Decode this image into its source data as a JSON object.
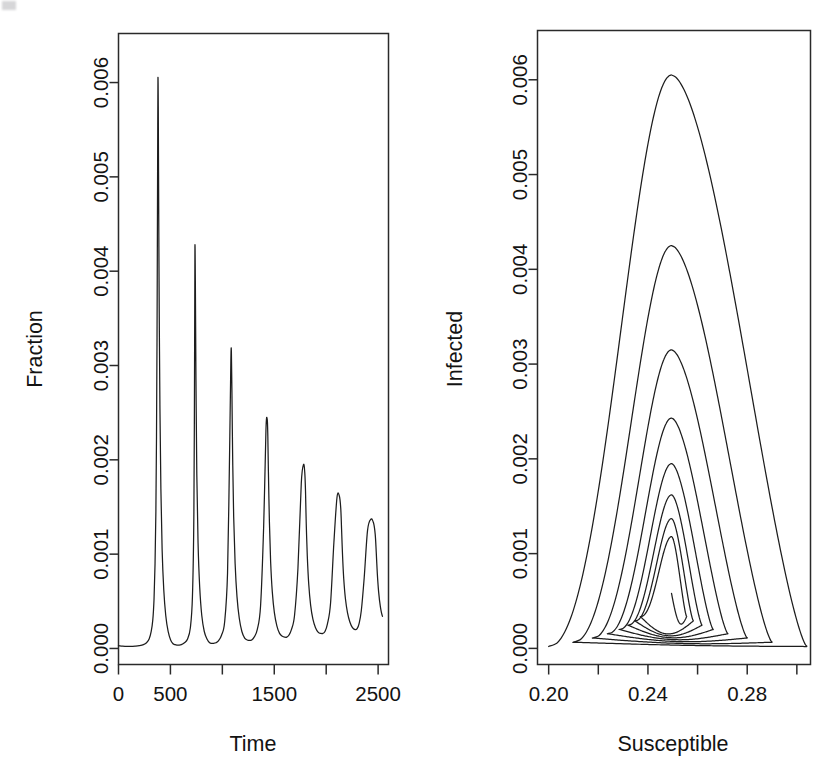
{
  "figure": {
    "background_color": "#ffffff",
    "line_color": "#1d1d1d",
    "panel_count": 2
  },
  "chart_data": [
    {
      "type": "line",
      "panel": "left",
      "title": "",
      "xlabel": "Time",
      "ylabel": "Fraction",
      "xlim": [
        0,
        2600
      ],
      "ylim": [
        -0.00017,
        0.00652
      ],
      "grid": false,
      "legend": null,
      "xticks": [
        0,
        500,
        1000,
        1500,
        2000,
        2500
      ],
      "xticklabels": [
        "0",
        "500",
        "",
        "1500",
        "",
        "2500"
      ],
      "yticks": [
        0.0,
        0.001,
        0.002,
        0.003,
        0.004,
        0.005,
        0.006
      ],
      "yticklabels": [
        "0.000",
        "0.001",
        "0.002",
        "0.003",
        "0.004",
        "0.005",
        "0.006"
      ],
      "description": "Damped epidemic oscillation: fraction infected over time",
      "peaks": [
        {
          "time": 380,
          "value": 0.00605
        },
        {
          "time": 735,
          "value": 0.00425
        },
        {
          "time": 1085,
          "value": 0.00315
        },
        {
          "time": 1430,
          "value": 0.00243
        },
        {
          "time": 1775,
          "value": 0.00195
        },
        {
          "time": 2110,
          "value": 0.00162
        },
        {
          "time": 2440,
          "value": 0.00137
        },
        {
          "time": 2770,
          "value": 0.00118
        }
      ],
      "troughs": [
        {
          "time": 560,
          "value": 3.5e-05
        },
        {
          "time": 915,
          "value": 5.5e-05
        },
        {
          "time": 1265,
          "value": 8.5e-05
        },
        {
          "time": 1610,
          "value": 0.00012
        },
        {
          "time": 1950,
          "value": 0.00016
        },
        {
          "time": 2285,
          "value": 0.0002
        },
        {
          "time": 2610,
          "value": 0.00025
        }
      ],
      "series": [
        {
          "name": "Infected fraction",
          "x": [
            0,
            40,
            80,
            120,
            160,
            200,
            240,
            270,
            295,
            315,
            330,
            342,
            352,
            360,
            366,
            371,
            375,
            378,
            380,
            383,
            387,
            392,
            399,
            408,
            420,
            436,
            455,
            478,
            502,
            525,
            545,
            562,
            580,
            605,
            635,
            665,
            692,
            712,
            726,
            733,
            736,
            740,
            746,
            754,
            766,
            782,
            802,
            826,
            852,
            878,
            900,
            918,
            938,
            962,
            992,
            1022,
            1050,
            1070,
            1082,
            1087,
            1092,
            1099,
            1109,
            1123,
            1141,
            1163,
            1188,
            1215,
            1240,
            1262,
            1282,
            1306,
            1336,
            1368,
            1398,
            1420,
            1432,
            1438,
            1444,
            1453,
            1465,
            1481,
            1501,
            1525,
            1551,
            1578,
            1601,
            1620,
            1640,
            1665,
            1695,
            1728,
            1760,
            1782,
            1794,
            1801,
            1808,
            1818,
            1832,
            1850,
            1872,
            1897,
            1924,
            1948,
            1968,
            1988,
            2012,
            2042,
            2074,
            2104,
            2126,
            2140,
            2148,
            2157,
            2169,
            2185,
            2205,
            2228,
            2253,
            2278,
            2298,
            2316,
            2338,
            2366,
            2398,
            2430,
            2456,
            2472,
            2482,
            2492,
            2505,
            2522,
            2542,
            2566,
            2590,
            2600
          ],
          "y": [
            3e-05,
            2.5e-05,
            2.2e-05,
            2.2e-05,
            2.5e-05,
            3e-05,
            4e-05,
            6e-05,
            0.0001,
            0.00018,
            0.0003,
            0.00052,
            0.0009,
            0.00145,
            0.00225,
            0.0033,
            0.00455,
            0.00555,
            0.00605,
            0.00575,
            0.0047,
            0.0036,
            0.00255,
            0.0017,
            0.00105,
            0.00062,
            0.00035,
            0.00018,
            9e-05,
            5e-05,
            4e-05,
            3.5e-05,
            3.5e-05,
            4e-05,
            6e-05,
            0.0001,
            0.00022,
            0.00055,
            0.00145,
            0.0032,
            0.00425,
            0.0039,
            0.00285,
            0.00185,
            0.00112,
            0.00065,
            0.00035,
            0.00018,
            0.0001,
            6e-05,
            5.5e-05,
            5.5e-05,
            6e-05,
            8e-05,
            0.00014,
            0.00028,
            0.0008,
            0.0021,
            0.00305,
            0.00315,
            0.00275,
            0.00205,
            0.0014,
            0.0009,
            0.00055,
            0.00032,
            0.00018,
            0.00011,
            9e-05,
            8.5e-05,
            9e-05,
            0.00012,
            0.0002,
            0.00045,
            0.0013,
            0.00232,
            0.00243,
            0.00225,
            0.00185,
            0.00135,
            0.00092,
            0.0006,
            0.00038,
            0.00024,
            0.00016,
            0.00013,
            0.00012,
            0.00012,
            0.00014,
            0.0002,
            0.00035,
            0.00085,
            0.00175,
            0.00195,
            0.00186,
            0.00166,
            0.00132,
            0.00098,
            0.00068,
            0.00046,
            0.00031,
            0.00022,
            0.00017,
            0.00016,
            0.00016,
            0.00018,
            0.00026,
            0.00048,
            0.00112,
            0.0016,
            0.00162,
            0.00149,
            0.00127,
            0.001,
            0.00074,
            0.00053,
            0.00038,
            0.00028,
            0.00022,
            0.0002,
            0.00021,
            0.00026,
            0.0004,
            0.00075,
            0.00125,
            0.00137,
            0.00133,
            0.00121,
            0.00102,
            0.0008,
            0.0006,
            0.00044,
            0.00034,
            0.00031
          ]
        }
      ]
    },
    {
      "type": "line",
      "panel": "right",
      "title": "",
      "xlabel": "Susceptible",
      "ylabel": "Infected",
      "xlim": [
        0.1955,
        0.3055
      ],
      "ylim": [
        -0.00017,
        0.00652
      ],
      "grid": false,
      "legend": null,
      "xticks": [
        0.2,
        0.22,
        0.24,
        0.26,
        0.28,
        0.3
      ],
      "xticklabels": [
        "0.20",
        "",
        "0.24",
        "",
        "0.28",
        ""
      ],
      "yticks": [
        0.0,
        0.001,
        0.002,
        0.003,
        0.004,
        0.005,
        0.006
      ],
      "yticklabels": [
        "0.000",
        "0.001",
        "0.002",
        "0.003",
        "0.004",
        "0.005",
        "0.006"
      ],
      "description": "Phase-plane spiral: infected vs susceptible converging to endemic equilibrium",
      "equilibrium": {
        "susceptible": 0.2495,
        "infected": 0.00058
      },
      "loops": [
        {
          "loop": 1,
          "peak_infected": 0.00605,
          "s_at_peak": 0.2495,
          "s_min": 0.2,
          "s_max": 0.304
        },
        {
          "loop": 2,
          "peak_infected": 0.00425,
          "s_at_peak": 0.2495,
          "s_min": 0.21,
          "s_max": 0.29
        },
        {
          "loop": 3,
          "peak_infected": 0.00315,
          "s_at_peak": 0.2495,
          "s_min": 0.2178,
          "s_max": 0.28
        },
        {
          "loop": 4,
          "peak_infected": 0.00243,
          "s_at_peak": 0.2495,
          "s_min": 0.2238,
          "s_max": 0.2722
        },
        {
          "loop": 5,
          "peak_infected": 0.00195,
          "s_at_peak": 0.2495,
          "s_min": 0.2285,
          "s_max": 0.2663
        },
        {
          "loop": 6,
          "peak_infected": 0.00162,
          "s_at_peak": 0.2495,
          "s_min": 0.232,
          "s_max": 0.2618
        },
        {
          "loop": 7,
          "peak_infected": 0.00137,
          "s_at_peak": 0.2495,
          "s_min": 0.2348,
          "s_max": 0.2583
        },
        {
          "loop": 8,
          "peak_infected": 0.00118,
          "s_at_peak": 0.2495,
          "s_min": 0.237,
          "s_max": 0.2556
        }
      ]
    }
  ]
}
